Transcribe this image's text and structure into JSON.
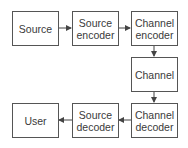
{
  "diagram": {
    "title": "",
    "nodes": [
      {
        "id": "source",
        "label": "Source"
      },
      {
        "id": "source_encoder",
        "label": "Source\nencoder"
      },
      {
        "id": "channel_encoder",
        "label": "Channel\nencoder"
      },
      {
        "id": "channel",
        "label": "Channel"
      },
      {
        "id": "channel_decoder",
        "label": "Channel\ndecoder"
      },
      {
        "id": "source_decoder",
        "label": "Source\ndecoder"
      },
      {
        "id": "user",
        "label": "User"
      }
    ],
    "edges": [
      {
        "from": "source",
        "to": "source_encoder"
      },
      {
        "from": "source_encoder",
        "to": "channel_encoder"
      },
      {
        "from": "channel_encoder",
        "to": "channel"
      },
      {
        "from": "channel",
        "to": "channel_decoder"
      },
      {
        "from": "channel_decoder",
        "to": "source_decoder"
      },
      {
        "from": "source_decoder",
        "to": "user"
      }
    ],
    "labels": {
      "source_l1": "Source",
      "senc_l1": "Source",
      "senc_l2": "encoder",
      "cenc_l1": "Channel",
      "cenc_l2": "encoder",
      "channel_l1": "Channel",
      "cdec_l1": "Channel",
      "cdec_l2": "decoder",
      "sdec_l1": "Source",
      "sdec_l2": "decoder",
      "user_l1": "User"
    },
    "colors": {
      "stroke": "#555555",
      "text": "#3a3a3a",
      "background": "#ffffff"
    }
  }
}
